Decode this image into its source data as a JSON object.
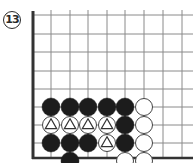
{
  "diagram": {
    "label": "13",
    "board": {
      "edges": [
        "left",
        "bottom"
      ],
      "col_x": [
        33,
        51,
        70,
        88,
        107,
        125,
        144,
        163,
        182
      ],
      "row_y": [
        15,
        34,
        52,
        71,
        89,
        107,
        125,
        143,
        161
      ],
      "grid_top": 10,
      "grid_right": 193,
      "left_edge_x": 33,
      "bottom_edge_y": 158,
      "line_color": "#8a8a8a",
      "edge_color": "#333333"
    },
    "stone_radius": 9,
    "stones": [
      {
        "col": 1,
        "row": 5,
        "color": "black"
      },
      {
        "col": 2,
        "row": 5,
        "color": "black"
      },
      {
        "col": 3,
        "row": 5,
        "color": "black"
      },
      {
        "col": 4,
        "row": 5,
        "color": "black"
      },
      {
        "col": 5,
        "row": 5,
        "color": "black"
      },
      {
        "col": 6,
        "row": 5,
        "color": "white"
      },
      {
        "col": 1,
        "row": 6,
        "color": "white",
        "mark": "triangle"
      },
      {
        "col": 2,
        "row": 6,
        "color": "white",
        "mark": "triangle"
      },
      {
        "col": 3,
        "row": 6,
        "color": "white",
        "mark": "triangle"
      },
      {
        "col": 4,
        "row": 6,
        "color": "white",
        "mark": "triangle"
      },
      {
        "col": 5,
        "row": 6,
        "color": "black"
      },
      {
        "col": 6,
        "row": 6,
        "color": "white"
      },
      {
        "col": 1,
        "row": 7,
        "color": "black"
      },
      {
        "col": 2,
        "row": 7,
        "color": "black"
      },
      {
        "col": 3,
        "row": 7,
        "color": "black"
      },
      {
        "col": 4,
        "row": 7,
        "color": "white",
        "mark": "triangle"
      },
      {
        "col": 5,
        "row": 7,
        "color": "black"
      },
      {
        "col": 6,
        "row": 7,
        "color": "white"
      },
      {
        "col": 2,
        "row": 8,
        "color": "black"
      },
      {
        "col": 5,
        "row": 8,
        "color": "white"
      },
      {
        "col": 6,
        "row": 8,
        "color": "white"
      }
    ],
    "colors": {
      "black_stone": "#1c1c1c",
      "white_stone": "#ffffff",
      "stone_outline": "#444444",
      "mark": "#333333"
    }
  }
}
